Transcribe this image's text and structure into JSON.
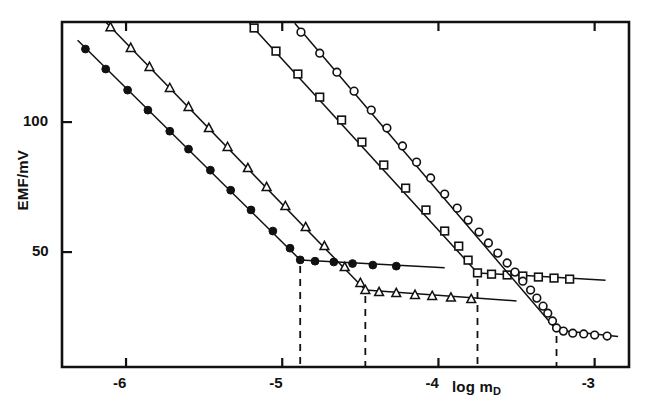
{
  "figure": {
    "background": "#ffffff",
    "ink": "#111111"
  },
  "axes": {
    "x_label": "log m",
    "x_label_sub": "D",
    "y_label": "EMF/mV",
    "x_ticks": [
      {
        "value": -6,
        "label": "-6"
      },
      {
        "value": -5,
        "label": "-5"
      },
      {
        "value": -4,
        "label": "-4"
      },
      {
        "value": -3,
        "label": "-3"
      }
    ],
    "y_ticks": [
      {
        "value": 100,
        "label": "100"
      },
      {
        "value": 50,
        "label": "50"
      }
    ],
    "frame": {
      "left": 62,
      "top": 22,
      "right": 629,
      "bottom": 367
    },
    "x_range": [
      -6.41,
      -2.78
    ],
    "y_range": [
      5.8,
      138.5
    ],
    "grid": false,
    "legend": "none"
  },
  "chart_data": {
    "type": "scatter",
    "title": "",
    "subtitle": "",
    "xlabel": "log m_D",
    "ylabel": "EMF/mV",
    "xlim": [
      -6.41,
      -2.78
    ],
    "ylim": [
      5.8,
      138.5
    ],
    "grid": false,
    "legend_position": "none",
    "annotations": [
      {
        "kind": "break-line",
        "style": "dashed",
        "x": -4.885
      },
      {
        "kind": "break-line",
        "style": "dashed",
        "x": -4.468
      },
      {
        "kind": "break-line",
        "style": "dashed",
        "x": -3.75
      },
      {
        "kind": "break-line",
        "style": "dashed",
        "x": -3.244
      }
    ],
    "series": [
      {
        "name": "filled-circles",
        "marker": "filled-circle",
        "marker_size": 7.5,
        "endpoint_x": -4.885,
        "line_segments": [
          {
            "x": [
              -6.31,
              -4.885
            ],
            "y": [
              131.5,
              47.0
            ]
          },
          {
            "x": [
              -4.885,
              -3.96
            ],
            "y": [
              47.0,
              44.0
            ]
          }
        ],
        "points": [
          {
            "x": -6.26,
            "y": 128.1
          },
          {
            "x": -6.13,
            "y": 120.4
          },
          {
            "x": -5.99,
            "y": 112.3
          },
          {
            "x": -5.86,
            "y": 104.6
          },
          {
            "x": -5.72,
            "y": 96.5
          },
          {
            "x": -5.6,
            "y": 89.6
          },
          {
            "x": -5.46,
            "y": 81.5
          },
          {
            "x": -5.33,
            "y": 73.8
          },
          {
            "x": -5.2,
            "y": 66.2
          },
          {
            "x": -5.06,
            "y": 58.1
          },
          {
            "x": -4.95,
            "y": 51.5
          },
          {
            "x": -4.885,
            "y": 47.0
          },
          {
            "x": -4.79,
            "y": 46.5
          },
          {
            "x": -4.67,
            "y": 46.2
          },
          {
            "x": -4.55,
            "y": 45.6
          },
          {
            "x": -4.42,
            "y": 45.0
          },
          {
            "x": -4.27,
            "y": 44.6
          }
        ]
      },
      {
        "name": "open-triangles",
        "marker": "open-triangle",
        "marker_size": 8,
        "endpoint_x": -4.468,
        "line_segments": [
          {
            "x": [
              -6.13,
              -4.468
            ],
            "y": [
              138.5,
              35.4
            ]
          },
          {
            "x": [
              -4.468,
              -3.5
            ],
            "y": [
              35.4,
              31.2
            ]
          }
        ],
        "points": [
          {
            "x": -6.1,
            "y": 136.5
          },
          {
            "x": -5.97,
            "y": 128.5
          },
          {
            "x": -5.85,
            "y": 121.2
          },
          {
            "x": -5.72,
            "y": 113.1
          },
          {
            "x": -5.6,
            "y": 105.8
          },
          {
            "x": -5.47,
            "y": 97.7
          },
          {
            "x": -5.35,
            "y": 90.4
          },
          {
            "x": -5.22,
            "y": 82.3
          },
          {
            "x": -5.1,
            "y": 75.0
          },
          {
            "x": -4.98,
            "y": 67.7
          },
          {
            "x": -4.85,
            "y": 59.6
          },
          {
            "x": -4.73,
            "y": 52.3
          },
          {
            "x": -4.6,
            "y": 44.2
          },
          {
            "x": -4.5,
            "y": 38.1
          },
          {
            "x": -4.468,
            "y": 35.4
          },
          {
            "x": -4.38,
            "y": 34.6
          },
          {
            "x": -4.27,
            "y": 34.2
          },
          {
            "x": -4.15,
            "y": 33.5
          },
          {
            "x": -4.04,
            "y": 33.1
          },
          {
            "x": -3.92,
            "y": 32.5
          },
          {
            "x": -3.79,
            "y": 31.9
          }
        ]
      },
      {
        "name": "open-squares",
        "marker": "open-square",
        "marker_size": 8,
        "endpoint_x": -3.75,
        "line_segments": [
          {
            "x": [
              -5.21,
              -3.75
            ],
            "y": [
              138.0,
              42.0
            ]
          },
          {
            "x": [
              -3.75,
              -2.93
            ],
            "y": [
              42.0,
              39.2
            ]
          }
        ],
        "points": [
          {
            "x": -5.18,
            "y": 136.2
          },
          {
            "x": -5.04,
            "y": 127.3
          },
          {
            "x": -4.9,
            "y": 118.5
          },
          {
            "x": -4.76,
            "y": 109.6
          },
          {
            "x": -4.62,
            "y": 100.8
          },
          {
            "x": -4.49,
            "y": 92.3
          },
          {
            "x": -4.35,
            "y": 83.5
          },
          {
            "x": -4.21,
            "y": 74.6
          },
          {
            "x": -4.08,
            "y": 66.2
          },
          {
            "x": -3.96,
            "y": 58.1
          },
          {
            "x": -3.87,
            "y": 52.3
          },
          {
            "x": -3.81,
            "y": 46.9
          },
          {
            "x": -3.75,
            "y": 42.0
          },
          {
            "x": -3.66,
            "y": 41.5
          },
          {
            "x": -3.56,
            "y": 41.2
          },
          {
            "x": -3.46,
            "y": 40.8
          },
          {
            "x": -3.36,
            "y": 40.4
          },
          {
            "x": -3.26,
            "y": 40.0
          },
          {
            "x": -3.16,
            "y": 39.6
          }
        ]
      },
      {
        "name": "open-circles",
        "marker": "open-circle",
        "marker_size": 8,
        "endpoint_x": -3.244,
        "line_segments": [
          {
            "x": [
              -4.92,
              -3.244
            ],
            "y": [
              138.0,
              20.0
            ]
          },
          {
            "x": [
              -3.244,
              -2.85
            ],
            "y": [
              20.0,
              17.5
            ]
          }
        ],
        "points": [
          {
            "x": -4.88,
            "y": 134.6
          },
          {
            "x": -4.76,
            "y": 126.5
          },
          {
            "x": -4.65,
            "y": 119.2
          },
          {
            "x": -4.54,
            "y": 111.9
          },
          {
            "x": -4.43,
            "y": 104.6
          },
          {
            "x": -4.33,
            "y": 97.7
          },
          {
            "x": -4.23,
            "y": 90.8
          },
          {
            "x": -4.14,
            "y": 84.6
          },
          {
            "x": -4.05,
            "y": 78.5
          },
          {
            "x": -3.96,
            "y": 72.3
          },
          {
            "x": -3.88,
            "y": 66.9
          },
          {
            "x": -3.81,
            "y": 62.3
          },
          {
            "x": -3.74,
            "y": 57.7
          },
          {
            "x": -3.68,
            "y": 53.5
          },
          {
            "x": -3.62,
            "y": 49.6
          },
          {
            "x": -3.56,
            "y": 45.8
          },
          {
            "x": -3.51,
            "y": 42.3
          },
          {
            "x": -3.46,
            "y": 38.8
          },
          {
            "x": -3.41,
            "y": 35.4
          },
          {
            "x": -3.37,
            "y": 32.3
          },
          {
            "x": -3.33,
            "y": 29.2
          },
          {
            "x": -3.3,
            "y": 26.5
          },
          {
            "x": -3.27,
            "y": 23.5
          },
          {
            "x": -3.244,
            "y": 20.8
          },
          {
            "x": -3.2,
            "y": 19.6
          },
          {
            "x": -3.14,
            "y": 18.8
          },
          {
            "x": -3.07,
            "y": 18.5
          },
          {
            "x": -3.0,
            "y": 18.1
          },
          {
            "x": -2.92,
            "y": 17.7
          }
        ]
      }
    ]
  }
}
